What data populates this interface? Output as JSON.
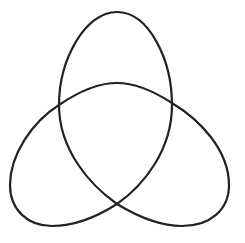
{
  "diagram": {
    "type": "trefoil-knot",
    "stroke_color": "#222222",
    "background_color": "#ffffff",
    "stroke_width": 2.2,
    "lobes": [
      {
        "name": "top",
        "extent": {
          "top": 12,
          "left": 59,
          "right": 172
        }
      },
      {
        "name": "bottom-left",
        "extent": {
          "left": 10,
          "bottom": 226
        }
      },
      {
        "name": "bottom-right",
        "extent": {
          "right": 229,
          "bottom": 226
        }
      }
    ],
    "crossings": [
      {
        "name": "left",
        "x": 59,
        "y": 105
      },
      {
        "name": "right",
        "x": 172,
        "y": 103
      },
      {
        "name": "bottom",
        "x": 117,
        "y": 204
      }
    ],
    "path": "M117,12 C85,12 59,60 59,105 C59,150 90,185 117,204 C140,218 160,226 182,226 C210,226 229,210 229,185 C229,150 200,120 172,103 C155,92 137,83 117,83 C97,83 78,92 59,105 C32,122 10,155 10,185 C10,210 28,226 52,226 C75,226 95,218 117,204 C144,185 172,150 172,105 C172,60 149,12 117,12 Z"
  }
}
